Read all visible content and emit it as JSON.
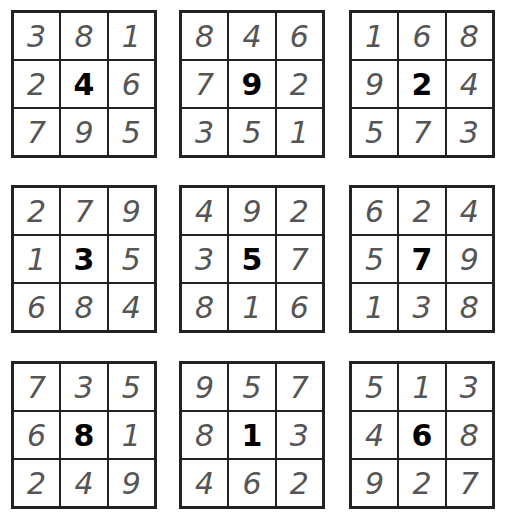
{
  "grids": [
    {
      "cells": [
        "3",
        "8",
        "1",
        "2",
        "4",
        "6",
        "7",
        "9",
        "5"
      ],
      "center": "4"
    },
    {
      "cells": [
        "8",
        "4",
        "6",
        "7",
        "9",
        "2",
        "3",
        "5",
        "1"
      ],
      "center": "9"
    },
    {
      "cells": [
        "1",
        "6",
        "8",
        "9",
        "2",
        "4",
        "5",
        "7",
        "3"
      ],
      "center": "2"
    },
    {
      "cells": [
        "2",
        "7",
        "9",
        "1",
        "3",
        "5",
        "6",
        "8",
        "4"
      ],
      "center": "3"
    },
    {
      "cells": [
        "4",
        "9",
        "2",
        "3",
        "5",
        "7",
        "8",
        "1",
        "6"
      ],
      "center": "5"
    },
    {
      "cells": [
        "6",
        "2",
        "4",
        "5",
        "7",
        "9",
        "1",
        "3",
        "8"
      ],
      "center": "7"
    },
    {
      "cells": [
        "7",
        "3",
        "5",
        "6",
        "8",
        "1",
        "2",
        "4",
        "9"
      ],
      "center": "8"
    },
    {
      "cells": [
        "9",
        "5",
        "7",
        "8",
        "1",
        "3",
        "4",
        "6",
        "2"
      ],
      "center": "1"
    },
    {
      "cells": [
        "5",
        "1",
        "3",
        "4",
        "6",
        "8",
        "9",
        "2",
        "7"
      ],
      "center": "6"
    }
  ]
}
